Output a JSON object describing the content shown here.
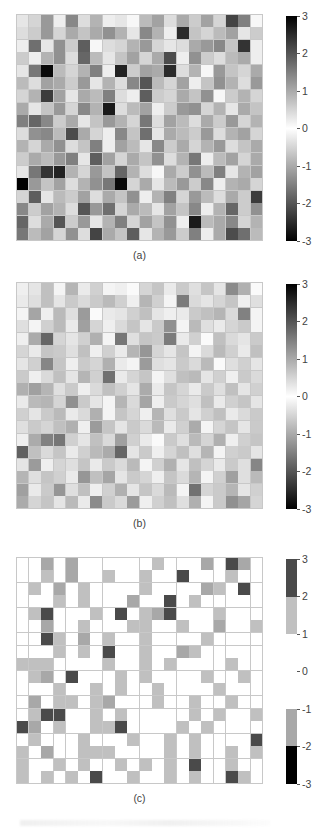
{
  "figure": {
    "panels": [
      {
        "id": "a",
        "label": "(a)",
        "colorbar": {
          "type": "continuous",
          "ticks": [
            3,
            2,
            1,
            0,
            -1,
            -2,
            -3
          ],
          "tick_labels": [
            "3",
            "2",
            "1",
            "0",
            "-1",
            "-2",
            "-3"
          ],
          "vmin": -3,
          "vmax": 3,
          "colormap": "gray-diverging-dark-at-extremes"
        }
      },
      {
        "id": "b",
        "label": "(b)",
        "colorbar": {
          "type": "continuous",
          "ticks": [
            3,
            2,
            1,
            0,
            -1,
            -2,
            -3
          ],
          "tick_labels": [
            "3",
            "2",
            "1",
            "0",
            "-1",
            "-2",
            "-3"
          ],
          "vmin": -3,
          "vmax": 3,
          "colormap": "gray-diverging-dark-at-extremes"
        }
      },
      {
        "id": "c",
        "label": "(c)",
        "colorbar": {
          "type": "discrete",
          "ticks": [
            3,
            2,
            1,
            0,
            -1,
            -2,
            -3
          ],
          "tick_labels": [
            "3",
            "2",
            "1",
            "0",
            "-1",
            "-2",
            "-3"
          ],
          "vmin": -3,
          "vmax": 3,
          "bands": [
            {
              "from": 2,
              "to": 3,
              "color": "#4a4a4a"
            },
            {
              "from": 1,
              "to": 2,
              "color": "#c0c0c0"
            },
            {
              "from": -1,
              "to": 1,
              "color": "#ffffff"
            },
            {
              "from": -2,
              "to": -1,
              "color": "#a8a8a8"
            },
            {
              "from": -3,
              "to": -2,
              "color": "#000000"
            }
          ],
          "colormap": "gray-quantized"
        }
      }
    ]
  },
  "chart_data": {
    "type": "heatmap",
    "title": "",
    "xlabel": "",
    "ylabel": "",
    "rows": 18,
    "cols": 20,
    "zlim": [
      -3,
      3
    ],
    "grid": true,
    "colorbar_position": "right",
    "panels": [
      {
        "name": "(a)",
        "rendering": "continuous",
        "values": [
          [
            -0.3,
            0.5,
            -1.2,
            0.2,
            -1.4,
            0.4,
            0.9,
            -0.2,
            0.3,
            -0.1,
            0.8,
            1.1,
            -0.4,
            1.0,
            0.6,
            -1.1,
            -0.5,
            2.2,
            -1.5,
            0.1
          ],
          [
            0.4,
            -0.6,
            1.2,
            0.5,
            -1.0,
            0.7,
            1.0,
            1.3,
            0.9,
            0.3,
            1.4,
            -0.9,
            0.2,
            2.5,
            -0.7,
            0.5,
            0.8,
            1.1,
            -0.3,
            0.6
          ],
          [
            -0.2,
            1.7,
            0.3,
            -1.3,
            0.6,
            1.9,
            0.1,
            0.4,
            -0.5,
            0.9,
            1.2,
            0.5,
            0.3,
            -0.4,
            1.0,
            -1.2,
            1.4,
            0.7,
            2.4,
            0.2
          ],
          [
            0.6,
            0.2,
            0.9,
            1.3,
            0.4,
            1.8,
            -0.8,
            0.3,
            0.7,
            -1.1,
            0.5,
            1.0,
            2.1,
            0.2,
            1.3,
            -0.6,
            0.4,
            0.8,
            1.0,
            -0.2
          ],
          [
            0.3,
            1.6,
            2.9,
            0.8,
            0.5,
            -0.9,
            1.5,
            0.2,
            2.6,
            0.6,
            1.1,
            -1.0,
            2.5,
            0.4,
            0.9,
            0.1,
            1.2,
            -0.7,
            0.5,
            1.0
          ],
          [
            0.8,
            0.4,
            -1.1,
            1.0,
            0.6,
            1.2,
            0.3,
            0.9,
            -0.4,
            1.4,
            2.0,
            -0.8,
            0.5,
            1.1,
            0.2,
            0.7,
            -1.3,
            0.9,
            0.4,
            1.2
          ],
          [
            0.5,
            0.9,
            2.3,
            1.1,
            0.3,
            -1.0,
            0.8,
            1.5,
            0.4,
            0.2,
            1.9,
            0.6,
            -0.5,
            1.0,
            0.7,
            1.3,
            0.1,
            -0.6,
            0.9,
            0.5
          ],
          [
            1.0,
            0.3,
            0.7,
            1.2,
            0.5,
            1.4,
            -0.9,
            2.7,
            0.4,
            0.8,
            1.1,
            0.2,
            0.6,
            -1.2,
            1.3,
            0.5,
            0.9,
            0.3,
            1.0,
            0.7
          ],
          [
            1.5,
            1.8,
            1.4,
            0.6,
            1.0,
            0.3,
            -0.7,
            1.2,
            0.9,
            0.5,
            1.6,
            0.4,
            1.1,
            0.8,
            -0.4,
            1.0,
            0.6,
            1.2,
            0.5,
            0.9
          ],
          [
            0.4,
            1.3,
            -1.4,
            0.8,
            2.1,
            1.0,
            0.5,
            0.2,
            1.4,
            0.7,
            1.7,
            0.3,
            1.0,
            -0.8,
            0.6,
            1.2,
            0.4,
            0.9,
            1.1,
            0.5
          ],
          [
            0.9,
            0.5,
            1.0,
            1.3,
            0.4,
            0.7,
            1.5,
            0.2,
            1.1,
            0.8,
            0.3,
            1.4,
            0.6,
            1.0,
            -0.5,
            0.9,
            1.2,
            0.4,
            0.7,
            1.0
          ],
          [
            0.6,
            -1.0,
            0.8,
            1.2,
            1.5,
            0.3,
            1.9,
            -1.1,
            0.5,
            1.0,
            0.7,
            1.3,
            0.4,
            0.9,
            1.6,
            0.2,
            0.8,
            1.1,
            0.5,
            1.0
          ],
          [
            0.3,
            1.6,
            2.4,
            2.6,
            0.9,
            0.5,
            1.2,
            0.7,
            1.8,
            -0.9,
            0.4,
            0.1,
            1.0,
            0.6,
            1.3,
            0.8,
            1.5,
            0.3,
            0.9,
            1.1
          ],
          [
            3.0,
            -1.2,
            0.7,
            1.1,
            0.4,
            0.9,
            1.3,
            1.6,
            2.9,
            0.5,
            1.0,
            0.3,
            0.8,
            1.2,
            0.6,
            1.4,
            0.2,
            0.9,
            1.0,
            0.5
          ],
          [
            0.5,
            1.9,
            0.3,
            0.8,
            0.6,
            1.1,
            0.4,
            1.0,
            0.7,
            1.3,
            0.2,
            0.9,
            1.5,
            0.5,
            1.2,
            0.8,
            0.4,
            1.0,
            0.6,
            2.3
          ],
          [
            1.4,
            0.6,
            -1.1,
            0.9,
            0.4,
            2.0,
            1.2,
            1.7,
            0.5,
            1.0,
            0.8,
            0.3,
            1.1,
            0.7,
            1.4,
            0.2,
            0.9,
            1.8,
            0.6,
            1.3
          ],
          [
            1.8,
            0.4,
            1.0,
            2.0,
            0.6,
            1.2,
            0.3,
            0.9,
            1.5,
            0.5,
            1.1,
            0.7,
            1.3,
            0.2,
            2.7,
            0.8,
            1.0,
            1.4,
            0.5,
            0.9
          ],
          [
            1.6,
            0.8,
            1.1,
            0.5,
            1.3,
            0.4,
            2.2,
            1.0,
            0.7,
            1.9,
            0.3,
            0.9,
            1.2,
            0.6,
            1.5,
            0.2,
            1.0,
            2.1,
            1.7,
            0.8
          ]
        ]
      },
      {
        "name": "(b)",
        "rendering": "continuous-low-contrast",
        "note": "Same spatial pattern as (a) with reduced magnitude / contrast"
      },
      {
        "name": "(c)",
        "rendering": "quantized",
        "note": "Same spatial pattern as (a) mapped through a 5-band discrete gray colormap"
      }
    ]
  }
}
